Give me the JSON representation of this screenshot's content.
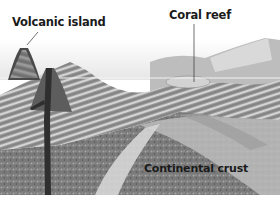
{
  "diagram": {
    "labels": {
      "volcanic_island": "Volcanic island",
      "coral_reef": "Coral reef",
      "continental_crust": "Continental crust"
    },
    "colors": {
      "background": "#ffffff",
      "sky_haze": "#ececec",
      "sea_line": "#d8d8d8",
      "rock_dark": "#5a5a5a",
      "rock_mid": "#8c8c8c",
      "rock_light": "#c4c4c4",
      "strata_light": "#e0e0e0",
      "label_text": "#1a1a1a"
    }
  }
}
